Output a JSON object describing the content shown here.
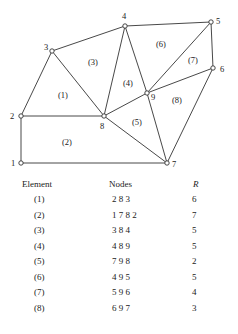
{
  "diagram": {
    "nodes": [
      {
        "id": "1",
        "x": 21,
        "y": 163
      },
      {
        "id": "2",
        "x": 21,
        "y": 116
      },
      {
        "id": "3",
        "x": 52,
        "y": 51
      },
      {
        "id": "4",
        "x": 125,
        "y": 26
      },
      {
        "id": "5",
        "x": 211,
        "y": 22
      },
      {
        "id": "6",
        "x": 213,
        "y": 68
      },
      {
        "id": "7",
        "x": 167,
        "y": 163
      },
      {
        "id": "8",
        "x": 104,
        "y": 116
      },
      {
        "id": "9",
        "x": 147,
        "y": 93
      }
    ],
    "element_labels": [
      "(1)",
      "(2)",
      "(3)",
      "(4)",
      "(5)",
      "(6)",
      "(7)",
      "(8)"
    ]
  },
  "table": {
    "headers": {
      "element": "Element",
      "nodes": "Nodes",
      "r": "R"
    },
    "rows": [
      {
        "element": "(1)",
        "nodes": "2 8 3",
        "r": "6"
      },
      {
        "element": "(2)",
        "nodes": "1 7 8 2",
        "r": "7"
      },
      {
        "element": "(3)",
        "nodes": "3 8 4",
        "r": "5"
      },
      {
        "element": "(4)",
        "nodes": "4 8 9",
        "r": "5"
      },
      {
        "element": "(5)",
        "nodes": "7 9 8",
        "r": "2"
      },
      {
        "element": "(6)",
        "nodes": "4 9 5",
        "r": "5"
      },
      {
        "element": "(7)",
        "nodes": "5 9 6",
        "r": "4"
      },
      {
        "element": "(8)",
        "nodes": "6 9 7",
        "r": "3"
      }
    ]
  }
}
